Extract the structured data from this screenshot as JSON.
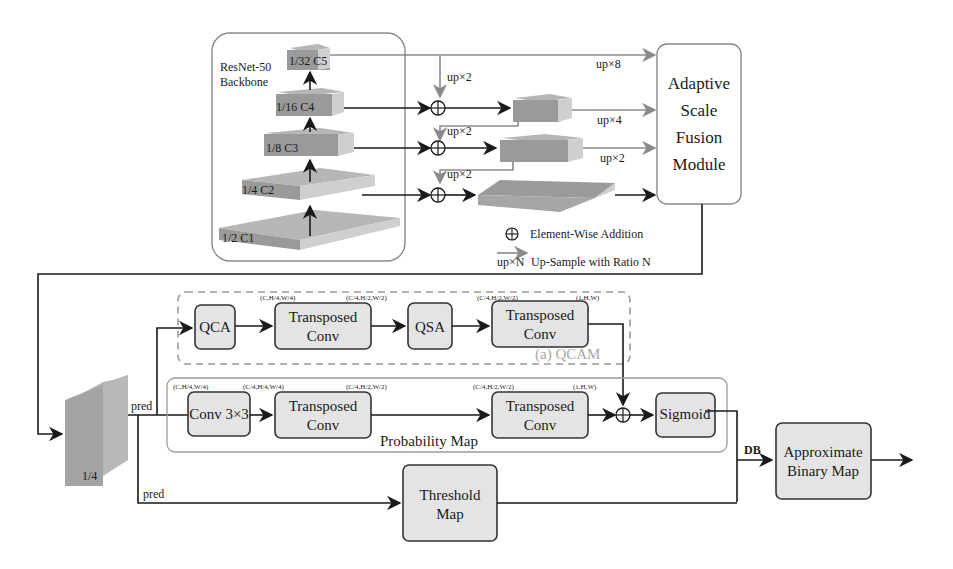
{
  "backbone": {
    "title_line1": "ResNet-50",
    "title_line2": "Backbone",
    "stages": [
      {
        "label": "1/32 C5"
      },
      {
        "label": "1/16 C4"
      },
      {
        "label": "1/8 C3"
      },
      {
        "label": "1/4 C2"
      },
      {
        "label": "1/2 C1"
      }
    ]
  },
  "fpn": {
    "upsample_labels": [
      "up×2",
      "up×2",
      "up×2"
    ],
    "to_asf_labels": [
      "up×8",
      "up×4",
      "up×2"
    ]
  },
  "asf": {
    "lines": [
      "Adaptive",
      "Scale",
      "Fusion",
      "Module"
    ]
  },
  "legend": {
    "addition_label": "Element-Wise Addition",
    "upsample_glyph": "up×N",
    "upsample_label": "Up-Sample with Ratio N"
  },
  "feature_map": {
    "label": "1/4",
    "pred_top": "pred",
    "pred_bottom": "pred"
  },
  "qcam": {
    "title": "(a) QCAM",
    "qca": "QCA",
    "tconv1_line1": "Transposed",
    "tconv1_line2": "Conv",
    "qsa": "QSA",
    "tconv2_line1": "Transposed",
    "tconv2_line2": "Conv",
    "dims": [
      "(C,H/4,W/4)",
      "(C/4,H/2,W/2)",
      "(C/4,H/2,W/2)",
      "(1,H,W)"
    ]
  },
  "probability_map": {
    "title": "Probability Map",
    "conv": "Conv 3×3",
    "tconv1_line1": "Transposed",
    "tconv1_line2": "Conv",
    "tconv2_line1": "Transposed",
    "tconv2_line2": "Conv",
    "sigmoid": "Sigmoid",
    "dims": [
      "(C,H/4,W/4)",
      "(C/4,H/4,W/4)",
      "(C/4,H/2,W/2)",
      "(C/4,H/2,W/2)",
      "(1,H,W)"
    ]
  },
  "threshold_map": {
    "line1": "Threshold",
    "line2": "Map"
  },
  "db_label": "DB",
  "output": {
    "line1": "Approximate",
    "line2": "Binary Map"
  }
}
